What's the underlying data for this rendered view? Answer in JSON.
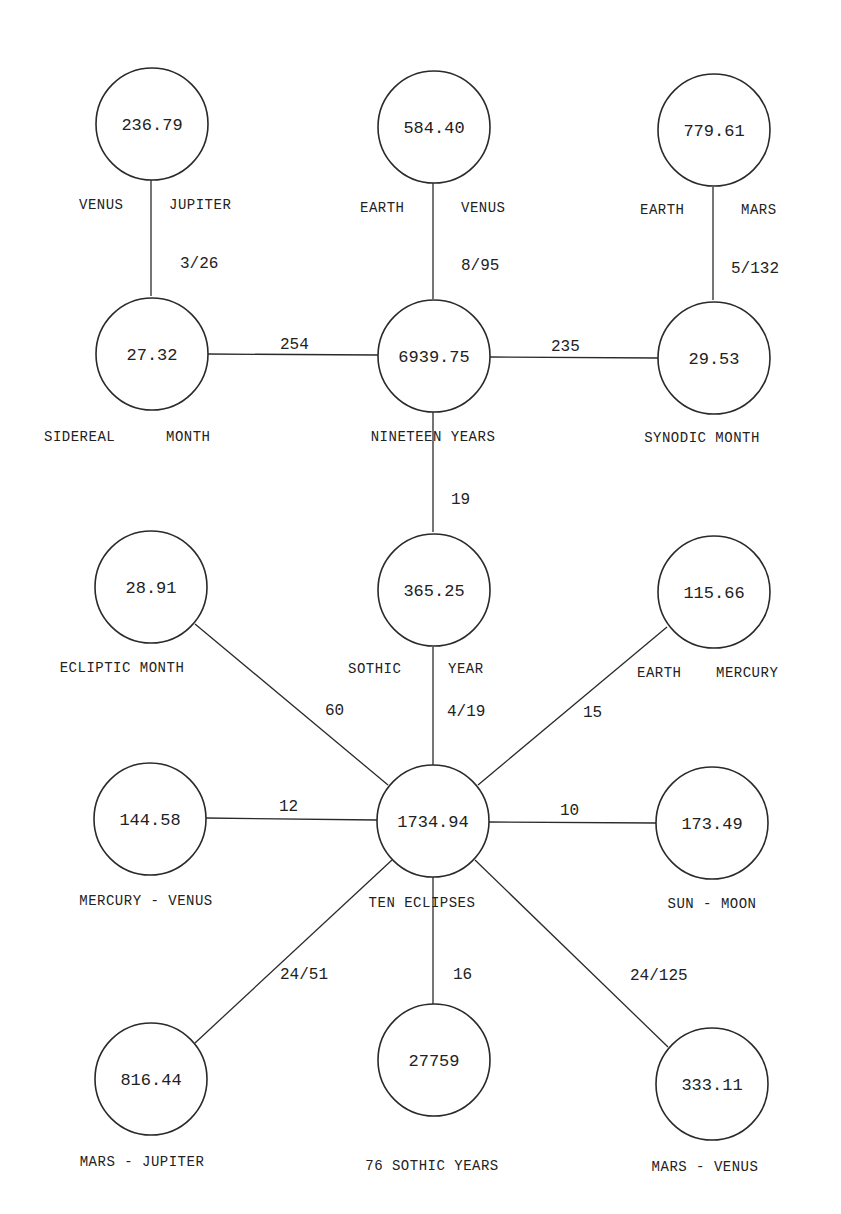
{
  "diagram": {
    "nodes": [
      {
        "id": "venus_jupiter",
        "value": "236.79",
        "labels": [
          "VENUS",
          "JUPITER"
        ]
      },
      {
        "id": "earth_venus",
        "value": "584.40",
        "labels": [
          "EARTH",
          "VENUS"
        ]
      },
      {
        "id": "earth_mars",
        "value": "779.61",
        "labels": [
          "EARTH",
          "MARS"
        ]
      },
      {
        "id": "sidereal_month",
        "value": "27.32",
        "labels": [
          "SIDEREAL",
          "MONTH"
        ]
      },
      {
        "id": "nineteen_years",
        "value": "6939.75",
        "labels": [
          "NINETEEN YEARS"
        ]
      },
      {
        "id": "synodic_month",
        "value": "29.53",
        "labels": [
          "SYNODIC MONTH"
        ]
      },
      {
        "id": "ecliptic_month",
        "value": "28.91",
        "labels": [
          "ECLIPTIC MONTH"
        ]
      },
      {
        "id": "sothic_year",
        "value": "365.25",
        "labels": [
          "SOTHIC",
          "YEAR"
        ]
      },
      {
        "id": "earth_mercury",
        "value": "115.66",
        "labels": [
          "EARTH",
          "MERCURY"
        ]
      },
      {
        "id": "mercury_venus",
        "value": "144.58",
        "labels": [
          "MERCURY - VENUS"
        ]
      },
      {
        "id": "ten_eclipses",
        "value": "1734.94",
        "labels": [
          "TEN ECLIPSES"
        ]
      },
      {
        "id": "sun_moon",
        "value": "173.49",
        "labels": [
          "SUN - MOON"
        ]
      },
      {
        "id": "mars_jupiter",
        "value": "816.44",
        "labels": [
          "MARS - JUPITER"
        ]
      },
      {
        "id": "sothic_76",
        "value": "27759",
        "labels": [
          "76 SOTHIC YEARS"
        ]
      },
      {
        "id": "mars_venus",
        "value": "333.11",
        "labels": [
          "MARS - VENUS"
        ]
      }
    ],
    "edges": [
      {
        "from": "venus_jupiter",
        "to": "sidereal_month",
        "label": "3/26"
      },
      {
        "from": "earth_venus",
        "to": "nineteen_years",
        "label": "8/95"
      },
      {
        "from": "earth_mars",
        "to": "synodic_month",
        "label": "5/132"
      },
      {
        "from": "sidereal_month",
        "to": "nineteen_years",
        "label": "254"
      },
      {
        "from": "nineteen_years",
        "to": "synodic_month",
        "label": "235"
      },
      {
        "from": "nineteen_years",
        "to": "sothic_year",
        "label": "19"
      },
      {
        "from": "sothic_year",
        "to": "ten_eclipses",
        "label": "4/19"
      },
      {
        "from": "ecliptic_month",
        "to": "ten_eclipses",
        "label": "60"
      },
      {
        "from": "earth_mercury",
        "to": "ten_eclipses",
        "label": "15"
      },
      {
        "from": "mercury_venus",
        "to": "ten_eclipses",
        "label": "12"
      },
      {
        "from": "ten_eclipses",
        "to": "sun_moon",
        "label": "10"
      },
      {
        "from": "ten_eclipses",
        "to": "mars_jupiter",
        "label": "24/51"
      },
      {
        "from": "ten_eclipses",
        "to": "sothic_76",
        "label": "16"
      },
      {
        "from": "ten_eclipses",
        "to": "mars_venus",
        "label": "24/125"
      }
    ]
  }
}
